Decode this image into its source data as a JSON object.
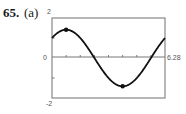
{
  "problem": {
    "number": "65.",
    "part": "(a)"
  },
  "chart_data": {
    "type": "line",
    "title": "",
    "xlabel": "",
    "ylabel": "",
    "function": "sin(x) + cos(x)",
    "xlim": [
      0,
      6.28
    ],
    "ylim": [
      -2,
      2
    ],
    "x_tick_step": 0.785398,
    "y_tick_step": 1,
    "tick_labels": {
      "y_top": "2",
      "y_bottom": "-2",
      "y_origin": "0",
      "x_right": "6.28"
    },
    "grid": false,
    "legend": null,
    "marked_points": [
      {
        "name": "relative-maximum",
        "x": 0.785,
        "y": 1.414
      },
      {
        "name": "relative-minimum",
        "x": 3.927,
        "y": -1.414
      }
    ],
    "series": [
      {
        "name": "f(x)",
        "x": [
          0,
          0.393,
          0.785,
          1.178,
          1.571,
          1.963,
          2.356,
          2.749,
          3.142,
          3.534,
          3.927,
          4.32,
          4.712,
          5.105,
          5.498,
          5.89,
          6.28
        ],
        "values": [
          1.0,
          1.307,
          1.414,
          1.307,
          1.0,
          0.541,
          0.0,
          -0.541,
          -1.0,
          -1.307,
          -1.414,
          -1.307,
          -1.0,
          -0.541,
          0.0,
          0.541,
          0.997
        ]
      }
    ]
  }
}
